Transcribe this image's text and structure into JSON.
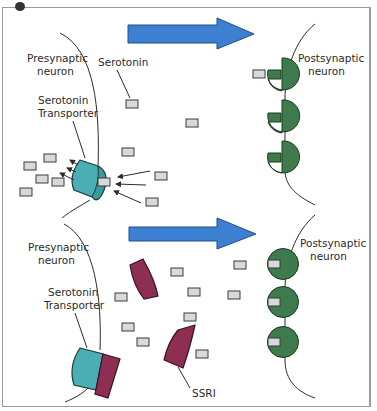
{
  "colors": {
    "arrow": "#3d7fd0",
    "receptor": "#3e7a4c",
    "transporter": "#4aafb5",
    "ssri": "#8e2e52",
    "serotonin": "#d9d9d9",
    "outline": "#2b2b2b"
  },
  "top_panel": {
    "presynaptic_label_line1": "Presynaptic",
    "presynaptic_label_line2": "neuron",
    "serotonin_label": "Serotonin",
    "transporter_label_line1": "Serotonin",
    "transporter_label_line2": "Transporter",
    "postsynaptic_label_line1": "Postsynaptic",
    "postsynaptic_label_line2": "neuron"
  },
  "bottom_panel": {
    "presynaptic_label_line1": "Presynaptic",
    "presynaptic_label_line2": "neuron",
    "transporter_label_line1": "Serotonin",
    "transporter_label_line2": "Transporter",
    "ssri_label": "SSRI",
    "postsynaptic_label_line1": "Postsynaptic",
    "postsynaptic_label_line2": "neuron"
  }
}
